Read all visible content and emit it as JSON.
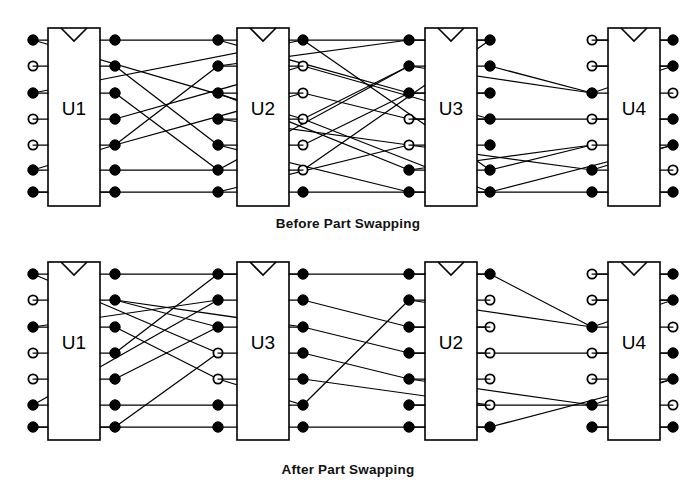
{
  "figure": {
    "line_color": "#000000",
    "pin_fill_color": "#000000",
    "pin_open_color": "#ffffff",
    "background": "#ffffff"
  },
  "panels": [
    {
      "id": "before",
      "caption": "Before Part Swapping",
      "caption_x": 348,
      "caption_y": 224,
      "components": [
        {
          "label": "U1",
          "box": {
            "x": 48,
            "y": 28,
            "w": 52,
            "h": 178
          },
          "left_pins": [
            "filled",
            "open",
            "filled",
            "open",
            "open",
            "filled",
            "filled"
          ],
          "right_pins": [
            "filled",
            "filled",
            "filled",
            "filled",
            "filled",
            "filled",
            "filled"
          ],
          "left_pin_x": 33,
          "right_pin_x": 115
        },
        {
          "label": "U2",
          "box": {
            "x": 237,
            "y": 28,
            "w": 52,
            "h": 178
          },
          "left_pins": [
            "filled",
            "filled",
            "filled",
            "filled",
            "filled",
            "filled",
            "filled"
          ],
          "right_pins": [
            "filled",
            "open",
            "open",
            "open",
            "open",
            "open",
            "filled"
          ],
          "left_pin_x": 218,
          "right_pin_x": 303
        },
        {
          "label": "U3",
          "box": {
            "x": 425,
            "y": 28,
            "w": 52,
            "h": 178
          },
          "left_pins": [
            "filled",
            "filled",
            "filled",
            "open",
            "open",
            "filled",
            "filled"
          ],
          "right_pins": [
            "filled",
            "filled",
            "filled",
            "filled",
            "filled",
            "filled",
            "filled"
          ],
          "left_pin_x": 409,
          "right_pin_x": 490
        },
        {
          "label": "U4",
          "box": {
            "x": 608,
            "y": 28,
            "w": 52,
            "h": 178
          },
          "left_pins": [
            "open",
            "open",
            "filled",
            "open",
            "open",
            "filled",
            "filled"
          ],
          "right_pins": [
            "filled",
            "filled",
            "open",
            "filled",
            "filled",
            "open",
            "filled"
          ],
          "left_pin_x": 592,
          "right_pin_x": 673
        }
      ],
      "pin_rows_y": [
        40,
        66,
        93,
        119,
        145,
        170,
        192
      ],
      "nets": [
        {
          "from": [
            115,
            40
          ],
          "to": [
            218,
            40
          ]
        },
        {
          "from": [
            33,
            40
          ],
          "to": [
            303,
            119
          ]
        },
        {
          "from": [
            115,
            66
          ],
          "to": [
            218,
            145
          ]
        },
        {
          "from": [
            33,
            93
          ],
          "to": [
            303,
            40
          ]
        },
        {
          "from": [
            115,
            93
          ],
          "to": [
            218,
            170
          ]
        },
        {
          "from": [
            115,
            119
          ],
          "to": [
            303,
            66
          ]
        },
        {
          "from": [
            115,
            145
          ],
          "to": [
            218,
            66
          ]
        },
        {
          "from": [
            33,
            170
          ],
          "to": [
            115,
            145
          ]
        },
        {
          "from": [
            115,
            170
          ],
          "to": [
            218,
            170
          ]
        },
        {
          "from": [
            115,
            192
          ],
          "to": [
            218,
            192
          ]
        },
        {
          "from": [
            33,
            192
          ],
          "to": [
            115,
            192
          ]
        },
        {
          "from": [
            115,
            145
          ],
          "to": [
            303,
            93
          ]
        },
        {
          "from": [
            218,
            40
          ],
          "to": [
            409,
            93
          ]
        },
        {
          "from": [
            303,
            40
          ],
          "to": [
            409,
            40
          ]
        },
        {
          "from": [
            218,
            66
          ],
          "to": [
            409,
            40
          ]
        },
        {
          "from": [
            303,
            119
          ],
          "to": [
            409,
            66
          ]
        },
        {
          "from": [
            218,
            93
          ],
          "to": [
            409,
            170
          ]
        },
        {
          "from": [
            303,
            66
          ],
          "to": [
            490,
            119
          ]
        },
        {
          "from": [
            218,
            119
          ],
          "to": [
            409,
            145
          ]
        },
        {
          "from": [
            303,
            93
          ],
          "to": [
            409,
            119
          ]
        },
        {
          "from": [
            218,
            145
          ],
          "to": [
            409,
            192
          ]
        },
        {
          "from": [
            303,
            145
          ],
          "to": [
            409,
            93
          ]
        },
        {
          "from": [
            218,
            170
          ],
          "to": [
            409,
            66
          ]
        },
        {
          "from": [
            303,
            170
          ],
          "to": [
            490,
            40
          ]
        },
        {
          "from": [
            218,
            192
          ],
          "to": [
            409,
            145
          ]
        },
        {
          "from": [
            303,
            192
          ],
          "to": [
            409,
            192
          ]
        },
        {
          "from": [
            303,
            40
          ],
          "to": [
            490,
            170
          ]
        },
        {
          "from": [
            303,
            119
          ],
          "to": [
            490,
            192
          ]
        },
        {
          "from": [
            409,
            40
          ],
          "to": [
            490,
            40
          ]
        },
        {
          "from": [
            409,
            66
          ],
          "to": [
            592,
            93
          ]
        },
        {
          "from": [
            409,
            93
          ],
          "to": [
            490,
            93
          ]
        },
        {
          "from": [
            409,
            119
          ],
          "to": [
            592,
            119
          ]
        },
        {
          "from": [
            409,
            145
          ],
          "to": [
            592,
            170
          ]
        },
        {
          "from": [
            409,
            170
          ],
          "to": [
            592,
            145
          ]
        },
        {
          "from": [
            409,
            192
          ],
          "to": [
            592,
            192
          ]
        },
        {
          "from": [
            490,
            66
          ],
          "to": [
            592,
            93
          ]
        },
        {
          "from": [
            490,
            170
          ],
          "to": [
            592,
            145
          ]
        },
        {
          "from": [
            490,
            192
          ],
          "to": [
            673,
            145
          ]
        },
        {
          "from": [
            592,
            40
          ],
          "to": [
            673,
            40
          ]
        },
        {
          "from": [
            592,
            66
          ],
          "to": [
            673,
            66
          ]
        },
        {
          "from": [
            592,
            93
          ],
          "to": [
            673,
            66
          ]
        },
        {
          "from": [
            592,
            119
          ],
          "to": [
            673,
            119
          ]
        },
        {
          "from": [
            592,
            170
          ],
          "to": [
            673,
            145
          ]
        },
        {
          "from": [
            592,
            192
          ],
          "to": [
            673,
            192
          ]
        }
      ]
    },
    {
      "id": "after",
      "caption": "After Part Swapping",
      "caption_x": 348,
      "caption_y": 470,
      "components": [
        {
          "label": "U1",
          "box": {
            "x": 48,
            "y": 262,
            "w": 52,
            "h": 178
          },
          "left_pins": [
            "filled",
            "open",
            "filled",
            "open",
            "open",
            "filled",
            "filled"
          ],
          "right_pins": [
            "filled",
            "filled",
            "filled",
            "filled",
            "filled",
            "filled",
            "filled"
          ],
          "left_pin_x": 33,
          "right_pin_x": 115
        },
        {
          "label": "U3",
          "box": {
            "x": 237,
            "y": 262,
            "w": 52,
            "h": 178
          },
          "left_pins": [
            "filled",
            "filled",
            "filled",
            "open",
            "open",
            "filled",
            "filled"
          ],
          "right_pins": [
            "filled",
            "filled",
            "filled",
            "filled",
            "filled",
            "filled",
            "filled"
          ],
          "left_pin_x": 218,
          "right_pin_x": 303
        },
        {
          "label": "U2",
          "box": {
            "x": 425,
            "y": 262,
            "w": 52,
            "h": 178
          },
          "left_pins": [
            "filled",
            "filled",
            "filled",
            "filled",
            "filled",
            "filled",
            "filled"
          ],
          "right_pins": [
            "filled",
            "open",
            "open",
            "open",
            "open",
            "open",
            "filled"
          ],
          "left_pin_x": 409,
          "right_pin_x": 490
        },
        {
          "label": "U4",
          "box": {
            "x": 608,
            "y": 262,
            "w": 52,
            "h": 178
          },
          "left_pins": [
            "open",
            "open",
            "filled",
            "open",
            "open",
            "filled",
            "filled"
          ],
          "right_pins": [
            "filled",
            "filled",
            "open",
            "filled",
            "filled",
            "open",
            "filled"
          ],
          "left_pin_x": 592,
          "right_pin_x": 673
        }
      ],
      "pin_rows_y": [
        274,
        300,
        327,
        353,
        379,
        405,
        427
      ],
      "nets": [
        {
          "from": [
            115,
            274
          ],
          "to": [
            218,
            274
          ]
        },
        {
          "from": [
            33,
            274
          ],
          "to": [
            218,
            353
          ]
        },
        {
          "from": [
            115,
            300
          ],
          "to": [
            218,
            327
          ]
        },
        {
          "from": [
            33,
            327
          ],
          "to": [
            218,
            300
          ]
        },
        {
          "from": [
            115,
            327
          ],
          "to": [
            218,
            379
          ]
        },
        {
          "from": [
            115,
            353
          ],
          "to": [
            218,
            274
          ]
        },
        {
          "from": [
            115,
            379
          ],
          "to": [
            218,
            327
          ]
        },
        {
          "from": [
            33,
            405
          ],
          "to": [
            218,
            300
          ]
        },
        {
          "from": [
            115,
            405
          ],
          "to": [
            218,
            405
          ]
        },
        {
          "from": [
            115,
            427
          ],
          "to": [
            218,
            427
          ]
        },
        {
          "from": [
            33,
            427
          ],
          "to": [
            115,
            427
          ]
        },
        {
          "from": [
            115,
            427
          ],
          "to": [
            218,
            353
          ]
        },
        {
          "from": [
            115,
            300
          ],
          "to": [
            303,
            327
          ]
        },
        {
          "from": [
            218,
            274
          ],
          "to": [
            303,
            274
          ]
        },
        {
          "from": [
            303,
            274
          ],
          "to": [
            409,
            274
          ]
        },
        {
          "from": [
            303,
            300
          ],
          "to": [
            409,
            327
          ]
        },
        {
          "from": [
            303,
            327
          ],
          "to": [
            409,
            353
          ]
        },
        {
          "from": [
            303,
            353
          ],
          "to": [
            409,
            379
          ]
        },
        {
          "from": [
            303,
            379
          ],
          "to": [
            490,
            405
          ]
        },
        {
          "from": [
            303,
            405
          ],
          "to": [
            409,
            300
          ]
        },
        {
          "from": [
            303,
            427
          ],
          "to": [
            409,
            427
          ]
        },
        {
          "from": [
            218,
            379
          ],
          "to": [
            303,
            405
          ]
        },
        {
          "from": [
            409,
            274
          ],
          "to": [
            490,
            274
          ]
        },
        {
          "from": [
            409,
            300
          ],
          "to": [
            592,
            327
          ]
        },
        {
          "from": [
            409,
            327
          ],
          "to": [
            490,
            327
          ]
        },
        {
          "from": [
            409,
            353
          ],
          "to": [
            592,
            353
          ]
        },
        {
          "from": [
            409,
            379
          ],
          "to": [
            592,
            405
          ]
        },
        {
          "from": [
            409,
            405
          ],
          "to": [
            490,
            405
          ]
        },
        {
          "from": [
            409,
            427
          ],
          "to": [
            490,
            427
          ]
        },
        {
          "from": [
            490,
            274
          ],
          "to": [
            592,
            327
          ]
        },
        {
          "from": [
            490,
            405
          ],
          "to": [
            592,
            405
          ]
        },
        {
          "from": [
            490,
            427
          ],
          "to": [
            673,
            379
          ]
        },
        {
          "from": [
            592,
            274
          ],
          "to": [
            673,
            274
          ]
        },
        {
          "from": [
            592,
            300
          ],
          "to": [
            673,
            300
          ]
        },
        {
          "from": [
            592,
            327
          ],
          "to": [
            673,
            300
          ]
        },
        {
          "from": [
            592,
            353
          ],
          "to": [
            673,
            353
          ]
        },
        {
          "from": [
            592,
            405
          ],
          "to": [
            673,
            379
          ]
        },
        {
          "from": [
            592,
            427
          ],
          "to": [
            673,
            427
          ]
        }
      ]
    }
  ],
  "geometry": {
    "pin_radius_filled": 5.2,
    "pin_radius_open": 4.6,
    "notch_width": 26,
    "notch_depth": 13
  }
}
